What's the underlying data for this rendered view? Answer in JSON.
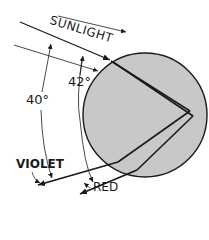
{
  "diagram": {
    "type": "rainbow-raindrop-refraction",
    "labels": {
      "sunlight": "SUNLIGHT",
      "angle_red": "42°",
      "angle_violet": "40°",
      "violet": "VIOLET",
      "red": "RED"
    },
    "colors": {
      "drop_fill": "#c8c8c8",
      "ray": "#1a1a1a",
      "background": "#ffffff"
    }
  }
}
